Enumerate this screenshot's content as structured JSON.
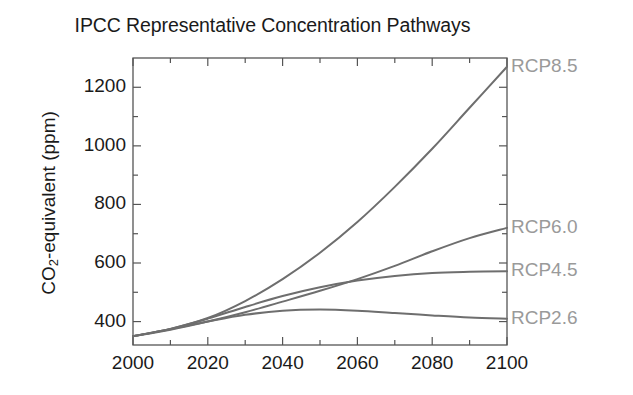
{
  "chart_data": {
    "type": "line",
    "title": "IPCC Representative Concentration Pathways",
    "xlabel": "",
    "ylabel": "CO2-equivalent (ppm)",
    "ylabel_parts": {
      "prefix": "CO",
      "sub": "2",
      "suffix": "-equivalent (ppm)"
    },
    "xlim": [
      2000,
      2100
    ],
    "ylim": [
      320,
      1300
    ],
    "grid": false,
    "legend_position": "right-inline",
    "xticks": [
      2000,
      2020,
      2040,
      2060,
      2080,
      2100
    ],
    "xtick_labels": [
      "2000",
      "2020",
      "2040",
      "2060",
      "2080",
      "2100"
    ],
    "xminor_step": 10,
    "yticks": [
      400,
      600,
      800,
      1000,
      1200
    ],
    "ytick_labels": [
      "400",
      "600",
      "800",
      "1000",
      "1200"
    ],
    "yminor_step": 100,
    "x": [
      2000,
      2010,
      2020,
      2030,
      2040,
      2050,
      2060,
      2070,
      2080,
      2090,
      2100
    ],
    "series": [
      {
        "name": "RCP8.5",
        "color": "#6e6e6e",
        "label": "RCP8.5",
        "values": [
          350,
          375,
          412,
          470,
          545,
          635,
          740,
          860,
          990,
          1130,
          1270
        ]
      },
      {
        "name": "RCP6.0",
        "color": "#6e6e6e",
        "label": "RCP6.0",
        "values": [
          350,
          372,
          400,
          432,
          468,
          505,
          545,
          590,
          640,
          685,
          720
        ]
      },
      {
        "name": "RCP4.5",
        "color": "#6e6e6e",
        "label": "RCP4.5",
        "values": [
          350,
          375,
          410,
          450,
          487,
          517,
          540,
          556,
          566,
          570,
          572
        ]
      },
      {
        "name": "RCP2.6",
        "color": "#6e6e6e",
        "label": "RCP2.6",
        "values": [
          350,
          374,
          400,
          423,
          437,
          441,
          437,
          429,
          421,
          414,
          410
        ]
      }
    ],
    "annotations": [
      {
        "text": "RCP8.5",
        "at_year": 2100,
        "at_value": 1270
      },
      {
        "text": "RCP6.0",
        "at_year": 2100,
        "at_value": 720
      },
      {
        "text": "RCP4.5",
        "at_year": 2100,
        "at_value": 572
      },
      {
        "text": "RCP2.6",
        "at_year": 2100,
        "at_value": 410
      }
    ],
    "colors": {
      "axis": "#555555",
      "line": "#6e6e6e",
      "text": "#1a1a1a",
      "label": "#9a9a9a",
      "background": "#ffffff"
    }
  }
}
